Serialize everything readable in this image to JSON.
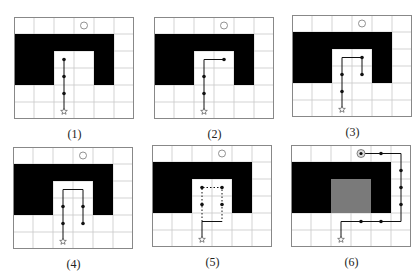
{
  "figure": {
    "grid": {
      "cols": 6,
      "rows": 6,
      "cell_w": 20,
      "cell_h": 17
    },
    "colors": {
      "grid_line": "#c8c8c8",
      "border": "#888888",
      "wall": "#000000",
      "explored": "#7a7a7a",
      "path": "#111111",
      "background": "#ffffff"
    },
    "wall_cells_desc": "U-shaped obstacle: top bar row 1 cols 0-4, left arm cols 0-1 rows 2-3, right arm col 4 rows 2-3",
    "start_icon": "star-icon",
    "goal_icon": "circle-icon",
    "goal": [
      3,
      0
    ],
    "start": [
      2,
      5
    ],
    "panels": [
      {
        "caption": "(1)",
        "x": 14,
        "y": 17,
        "gray_inner": false,
        "solid_path": [
          [
            2,
            5
          ],
          [
            2,
            2
          ]
        ],
        "dotted_paths": [],
        "dots": [
          [
            2,
            2
          ],
          [
            2,
            3
          ],
          [
            2,
            4
          ]
        ],
        "goal_ringed": false
      },
      {
        "caption": "(2)",
        "x": 154,
        "y": 17,
        "gray_inner": false,
        "solid_path": [
          [
            2,
            5
          ],
          [
            2,
            2
          ],
          [
            3,
            2
          ]
        ],
        "dotted_paths": [],
        "dots": [
          [
            2,
            3
          ],
          [
            2,
            4
          ],
          [
            3,
            2
          ]
        ],
        "goal_ringed": false
      },
      {
        "caption": "(3)",
        "x": 292,
        "y": 15,
        "gray_inner": false,
        "solid_path": [
          [
            2,
            5
          ],
          [
            2,
            2
          ],
          [
            3,
            2
          ],
          [
            3,
            3
          ]
        ],
        "dotted_paths": [],
        "dots": [
          [
            2,
            3
          ],
          [
            2,
            4
          ],
          [
            3,
            2
          ],
          [
            3,
            3
          ]
        ],
        "goal_ringed": false
      },
      {
        "caption": "(4)",
        "x": 13,
        "y": 147,
        "gray_inner": false,
        "solid_path": [
          [
            2,
            5
          ],
          [
            2,
            2
          ],
          [
            3,
            2
          ],
          [
            3,
            4
          ]
        ],
        "dotted_paths": [],
        "dots": [
          [
            2,
            3
          ],
          [
            2,
            4
          ],
          [
            3,
            3
          ],
          [
            3,
            4
          ]
        ],
        "goal_ringed": false
      },
      {
        "caption": "(5)",
        "x": 152,
        "y": 145,
        "gray_inner": false,
        "solid_path": [
          [
            2,
            5
          ],
          [
            2,
            4
          ],
          [
            3,
            4
          ]
        ],
        "dotted_paths": [
          [
            [
              2,
              4
            ],
            [
              2,
              2
            ],
            [
              3,
              2
            ],
            [
              3,
              4
            ]
          ]
        ],
        "dots": [
          [
            2,
            2
          ],
          [
            3,
            2
          ],
          [
            2,
            3
          ],
          [
            3,
            3
          ]
        ],
        "goal_ringed": false
      },
      {
        "caption": "(6)",
        "x": 291,
        "y": 145,
        "gray_inner": true,
        "solid_path": [
          [
            2,
            5
          ],
          [
            2,
            4
          ],
          [
            5,
            4
          ],
          [
            5,
            0
          ],
          [
            3,
            0
          ]
        ],
        "dotted_paths": [],
        "dots": [
          [
            3,
            4
          ],
          [
            4,
            4
          ],
          [
            5,
            1
          ],
          [
            5,
            2
          ],
          [
            5,
            3
          ],
          [
            4,
            0
          ]
        ],
        "goal_ringed": true
      }
    ]
  }
}
